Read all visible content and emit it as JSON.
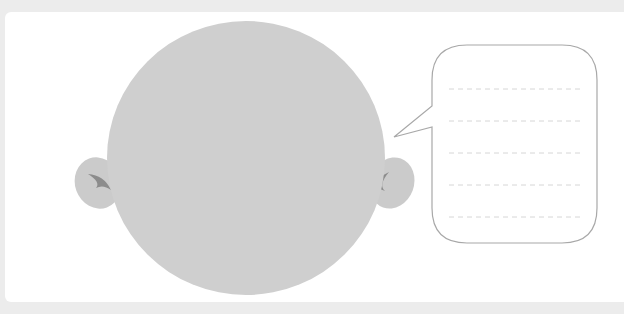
{
  "worksheet": {
    "title": "",
    "face": {
      "fill": "#cfcfcf",
      "ear_fill": "#c9c9c9",
      "ear_mark": "#8a8a8a"
    },
    "speech_bubble": {
      "stroke": "#a8a8a8",
      "writing_lines": 5,
      "line_color": "#d8d8d8",
      "text": ""
    },
    "background": "#ececec",
    "card": "#ffffff"
  }
}
